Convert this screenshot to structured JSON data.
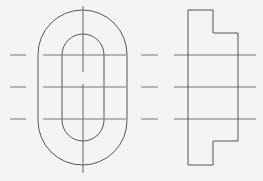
{
  "drawing": {
    "type": "orthographic-projection",
    "views": [
      "front-view",
      "side-view"
    ],
    "colors": {
      "background": "#f4f4f2",
      "outline": "#555555",
      "centerline": "#888888"
    },
    "front_view": {
      "outer_stadium": {
        "x": 38,
        "y": 10,
        "width": 89,
        "height": 155
      },
      "inner_stadium": {
        "x": 62,
        "y": 34,
        "width": 42,
        "height": 107
      },
      "vertical_centerline_x": 83
    },
    "side_view": {
      "profile_points": "188,10 213,10 213,33 238,33 238,141 213,141 213,165 188,165"
    },
    "horizontal_lines_y": [
      55,
      87,
      119
    ]
  }
}
